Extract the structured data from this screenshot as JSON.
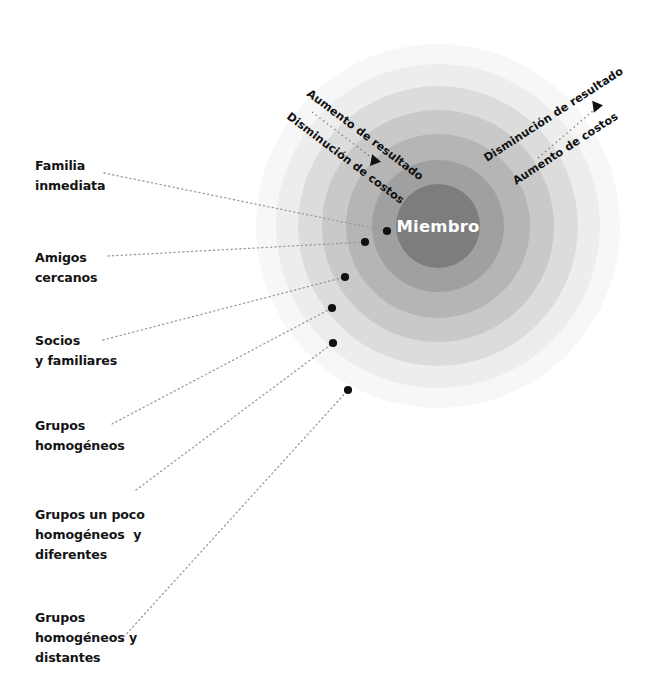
{
  "diagram": {
    "title_center": "Miembro",
    "background_color": "#ffffff",
    "ring_colors": [
      "#7d7d7d",
      "#a0a0a0",
      "#b5b5b5",
      "#c9c9c9",
      "#dcdcdc",
      "#ededed",
      "#f7f7f7"
    ],
    "dot_color": "#111111",
    "connector_color": "#9a9a9a",
    "center": {
      "x": 438,
      "y": 226
    },
    "rings": [
      {
        "name": "ring-core",
        "radius": 42,
        "color": "#7d7d7d"
      },
      {
        "name": "ring-2",
        "radius": 66,
        "color": "#a0a0a0"
      },
      {
        "name": "ring-3",
        "radius": 92,
        "color": "#b5b5b5"
      },
      {
        "name": "ring-4",
        "radius": 116,
        "color": "#c9c9c9"
      },
      {
        "name": "ring-5",
        "radius": 140,
        "color": "#dcdcdc"
      },
      {
        "name": "ring-6",
        "radius": 162,
        "color": "#ededed"
      },
      {
        "name": "ring-7",
        "radius": 182,
        "color": "#f7f7f7"
      }
    ],
    "axis_labels": {
      "left_upper": "Aumento de resultado",
      "left_lower": "Disminución de costos",
      "right_upper": "Disminución de resultado",
      "right_lower": "Aumento de costos"
    },
    "levels": [
      {
        "id": "familia-inmediata",
        "lines": [
          "Familia",
          "inmediata"
        ],
        "label_x": 35,
        "label_y": 156,
        "dot": {
          "x": 387,
          "y": 231
        },
        "connector_start": {
          "x": 104,
          "y": 173
        }
      },
      {
        "id": "amigos-cercanos",
        "lines": [
          "Amigos",
          "cercanos"
        ],
        "label_x": 35,
        "label_y": 248,
        "dot": {
          "x": 365,
          "y": 242
        },
        "connector_start": {
          "x": 108,
          "y": 256
        }
      },
      {
        "id": "socios-y-familiares",
        "lines": [
          "Socios",
          "y familiares"
        ],
        "label_x": 35,
        "label_y": 331,
        "dot": {
          "x": 345,
          "y": 277
        },
        "connector_start": {
          "x": 103,
          "y": 340
        }
      },
      {
        "id": "grupos-homogeneos",
        "lines": [
          "Grupos",
          "homogéneos"
        ],
        "label_x": 35,
        "label_y": 416,
        "dot": {
          "x": 332,
          "y": 308
        },
        "connector_start": {
          "x": 112,
          "y": 424
        }
      },
      {
        "id": "grupos-un-poco-homogeneos-y-diferentes",
        "lines": [
          "Grupos un poco",
          "homogéneos  y",
          "diferentes"
        ],
        "label_x": 35,
        "label_y": 505,
        "dot": {
          "x": 333,
          "y": 343
        },
        "connector_start": {
          "x": 136,
          "y": 490
        }
      },
      {
        "id": "grupos-homogeneos-y-distantes",
        "lines": [
          "Grupos",
          "homogéneos y",
          "distantes"
        ],
        "label_x": 35,
        "label_y": 608,
        "dot": {
          "x": 348,
          "y": 390
        },
        "connector_start": {
          "x": 121,
          "y": 640
        }
      }
    ]
  }
}
